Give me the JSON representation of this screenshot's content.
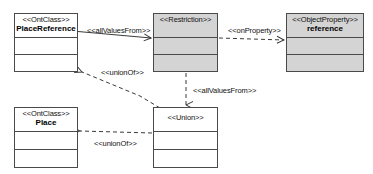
{
  "diagram": {
    "type": "uml-class-diagram",
    "title": "",
    "nodes": [
      {
        "id": "place-reference",
        "stereotype": "<<OntClass>>",
        "name": "PlaceReference",
        "fill": "#ffffff",
        "x": 14,
        "y": 13,
        "w": 64,
        "h": 59
      },
      {
        "id": "restriction",
        "stereotype": "<<Restriction>>",
        "name": "",
        "fill": "#d4d4d4",
        "x": 153,
        "y": 13,
        "w": 65,
        "h": 59
      },
      {
        "id": "object-property-reference",
        "stereotype": "<<ObjectProperty>>",
        "name": "reference",
        "fill": "#d4d4d4",
        "x": 286,
        "y": 13,
        "w": 78,
        "h": 59
      },
      {
        "id": "place",
        "stereotype": "<<OntClass>>",
        "name": "Place",
        "fill": "#ffffff",
        "x": 14,
        "y": 107,
        "w": 64,
        "h": 61
      },
      {
        "id": "union",
        "stereotype": "<<Union>>",
        "name": "",
        "fill": "#ffffff",
        "x": 153,
        "y": 107,
        "w": 65,
        "h": 61
      }
    ],
    "edges": [
      {
        "id": "all-values-from-place-reference-restriction",
        "label": "<<allValuesFrom>>",
        "style": "solid",
        "from": "place-reference",
        "to": "restriction",
        "label_x": 87,
        "label_y": 26
      },
      {
        "id": "on-property-restriction-reference",
        "label": "<<onProperty>>",
        "style": "dashed",
        "from": "restriction",
        "to": "object-property-reference",
        "label_x": 228,
        "label_y": 26
      },
      {
        "id": "union-of-union-place-reference",
        "label": "<<unionOf>>",
        "style": "dashed",
        "from": "union",
        "to": "place-reference",
        "label_x": 101,
        "label_y": 68
      },
      {
        "id": "all-values-from-restriction-union",
        "label": "<<allValuesFrom>>",
        "style": "dashed",
        "from": "restriction",
        "to": "union",
        "label_x": 193,
        "label_y": 86
      },
      {
        "id": "union-of-union-place",
        "label": "<<unionOf>>",
        "style": "dashed",
        "from": "union",
        "to": "place",
        "label_x": 94,
        "label_y": 139
      }
    ]
  },
  "colors": {
    "line": "#3a3a3a",
    "fill_gray": "#d4d4d4",
    "fill_white": "#ffffff",
    "text": "#111111",
    "background": "#ffffff"
  }
}
